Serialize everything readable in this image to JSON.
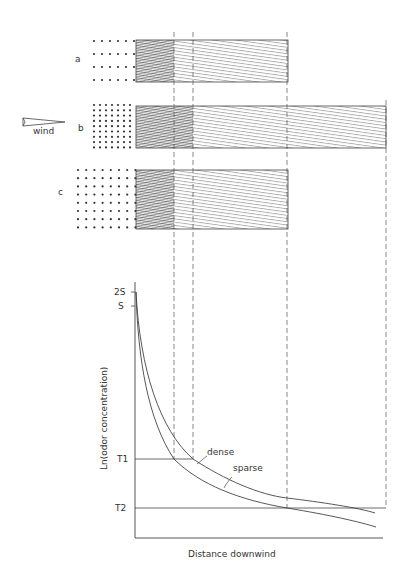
{
  "figure": {
    "panels": [
      {
        "id": "a",
        "label": "a"
      },
      {
        "id": "b",
        "label": "b"
      },
      {
        "id": "c",
        "label": "c"
      }
    ],
    "wind_label": "wind",
    "graph": {
      "y_axis_label": "Ln(odor concentration)",
      "x_axis_label": "Distance   downwind",
      "y_ticks": [
        "2S",
        "S",
        "T1",
        "T2"
      ],
      "curve_labels": {
        "dense": "dense",
        "sparse": "sparse"
      }
    }
  },
  "colors": {
    "ink": "#333333",
    "background": "#ffffff"
  }
}
